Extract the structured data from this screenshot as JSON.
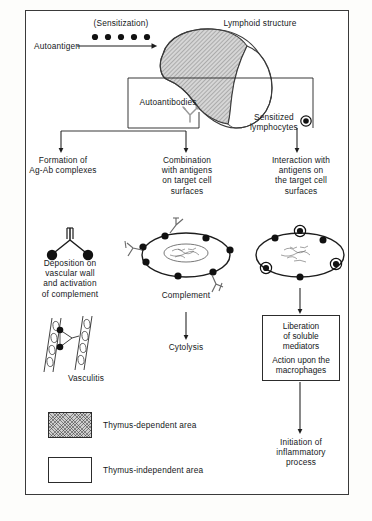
{
  "figure": {
    "title_visible": false,
    "colors": {
      "ink": "#15181a",
      "line": "#2c2c2c",
      "frame": "#3a3a3a",
      "hatch_fill": "#cfcfcf",
      "paper": "#ffffff"
    }
  },
  "top": {
    "autoantigen_label": "Autoantigen",
    "sensitization_label": "(Sensitization)",
    "lymphoid_label": "Lymphoid structure",
    "antigen_dot_count": 5
  },
  "middle": {
    "autoantibodies_label": "Autoantibodies",
    "antibody_icon": "antibody-y-icon",
    "sensitized_label": "Sensitized\nlymphocytes",
    "lymphocyte_icon": "sensitized-lymphocyte-dot-icon"
  },
  "columns": [
    {
      "id": "col-left",
      "heading": "Formation of\nAg-Ab complexes",
      "icon": "ag-ab-complex-icon",
      "caption": "Deposition on\nvascular wall\nand activation\nof complement",
      "second_icon": "vasculitis-vessel-icon",
      "second_caption": "Vasculitis"
    },
    {
      "id": "col-middle",
      "heading": "Combination\nwith antigens\non target cell\nsurfaces",
      "icon": "target-cell-with-antibodies-icon",
      "caption": "Complement",
      "outcome": "Cytolysis"
    },
    {
      "id": "col-right",
      "heading": "Interaction with\nantigens on\nthe target cell\nsurfaces",
      "icon": "target-cell-with-lymphocytes-icon",
      "box_line_1": "Liberation\nof soluble\nmediators",
      "box_line_2": "Action upon the\nmacrophages",
      "outcome": "Initiation of\ninflammatory\nprocess"
    }
  ],
  "legend": {
    "items": [
      {
        "swatch": "hatched",
        "label": "Thymus-dependent area"
      },
      {
        "swatch": "plain",
        "label": "Thymus-independent area"
      }
    ]
  }
}
